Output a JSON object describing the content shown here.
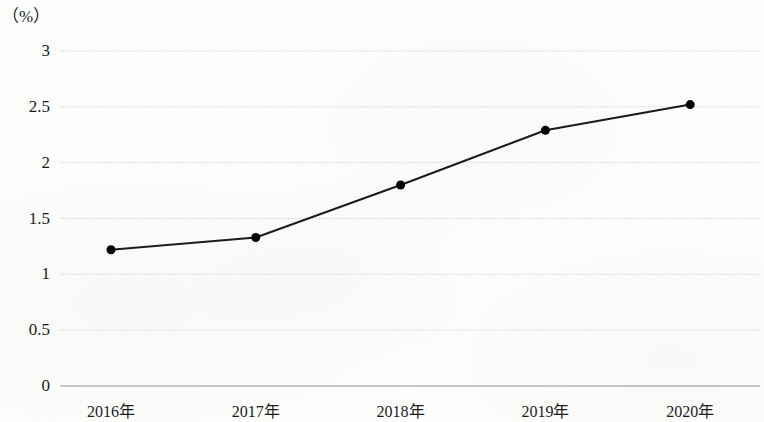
{
  "chart_data": {
    "type": "line",
    "title": "",
    "subtitle": "",
    "unit_label": "（%）",
    "xlabel": "",
    "ylabel": "",
    "categories": [
      "2016年",
      "2017年",
      "2018年",
      "2019年",
      "2020年"
    ],
    "series": [
      {
        "name": "",
        "values": [
          1.22,
          1.33,
          1.8,
          2.29,
          2.52
        ]
      }
    ],
    "ytick_labels": [
      "0",
      "0.5",
      "1",
      "1.5",
      "2",
      "2.5",
      "3"
    ],
    "ytick_values": [
      0,
      0.5,
      1,
      1.5,
      2,
      2.5,
      3
    ],
    "ylim": [
      0,
      3
    ],
    "grid": true,
    "grid_axis": "y",
    "legend": "none",
    "colors": {
      "line": "#1a1a1a",
      "marker": "#000000",
      "grid": "#d6d6d6",
      "axis": "#bdbdbd",
      "background": "#fdfdfc",
      "text": "#1b1b1b"
    },
    "line_width": 2,
    "marker_size": 9,
    "marker_shape": "circle"
  },
  "axis": {
    "y_label_0": "0",
    "y_label_1": "0.5",
    "y_label_2": "1",
    "y_label_3": "1.5",
    "y_label_4": "2",
    "y_label_5": "2.5",
    "y_label_6": "3",
    "x_label_0": "2016年",
    "x_label_1": "2017年",
    "x_label_2": "2018年",
    "x_label_3": "2019年",
    "x_label_4": "2020年"
  }
}
